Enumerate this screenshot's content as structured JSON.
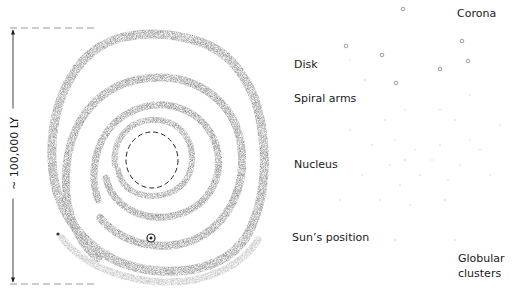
{
  "diagram": {
    "scale": {
      "label": "~ 100,000 LY"
    },
    "labels": {
      "disk": "Disk",
      "spiral_arms": "Spiral arms",
      "nucleus": "Nucleus",
      "sun_position": "Sun’s position",
      "corona": "Corona",
      "globular_clusters_line1": "Globular",
      "globular_clusters_line2": "clusters"
    },
    "views": [
      {
        "name": "face-on",
        "elements": [
          "spiral-arms",
          "nucleus-dashed-circle",
          "sun-marker"
        ]
      },
      {
        "name": "edge-on",
        "elements": [
          "disk-rod",
          "nuclear-bulge",
          "sun-marker",
          "globular-clusters",
          "corona-halo"
        ]
      }
    ],
    "colors": {
      "ink": "#1a1a1a",
      "arm": "#8a8a8a",
      "halo_dots": "#bdbdbd",
      "background": "#ffffff"
    }
  }
}
